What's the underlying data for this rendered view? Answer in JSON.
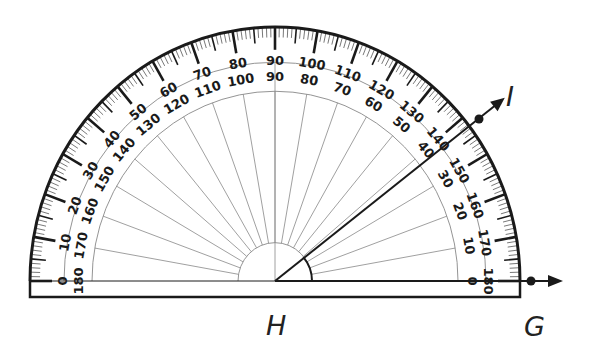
{
  "figure": {
    "type": "protractor-angle-measurement",
    "vertex_label": "H",
    "ray_labels": [
      "G",
      "I"
    ],
    "angle_name": "GHI",
    "measured_angle_deg": 40
  },
  "protractor": {
    "center": [
      275,
      281
    ],
    "outer_radius_x": 245,
    "outer_radius_y": 254,
    "middle_arc_radius": 211,
    "inner_arc_radius": 183,
    "hub_radius": 37,
    "base_bottom_y": 297,
    "outer_scale_labels": [
      "0",
      "10",
      "20",
      "30",
      "40",
      "50",
      "60",
      "70",
      "80",
      "90",
      "100",
      "110",
      "120",
      "130",
      "140",
      "150",
      "160",
      "170",
      "180"
    ],
    "inner_scale_labels": [
      "180",
      "170",
      "160",
      "150",
      "140",
      "130",
      "120",
      "110",
      "100",
      "90",
      "80",
      "70",
      "60",
      "50",
      "40",
      "30",
      "20",
      "10",
      "0"
    ]
  },
  "labels": {
    "H": "H",
    "G": "G",
    "I": "I"
  },
  "colors": {
    "ink": "#1a1a1a",
    "thin_line": "#888888",
    "background": "#ffffff"
  }
}
